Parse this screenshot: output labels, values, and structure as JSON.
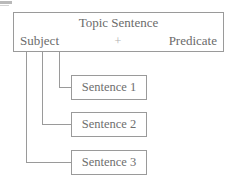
{
  "diagram": {
    "title_box": {
      "heading": "Topic Sentence",
      "left_label": "Subject",
      "operator": "+",
      "right_label": "Predicate"
    },
    "sentences": [
      {
        "label": "Sentence 1"
      },
      {
        "label": "Sentence 2"
      },
      {
        "label": "Sentence 3"
      }
    ],
    "colors": {
      "stroke": "#9a9a9a",
      "text": "#6e6e6e",
      "operator": "#b0b0b0",
      "background": "#ffffff"
    }
  }
}
